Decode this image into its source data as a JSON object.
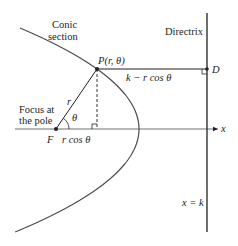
{
  "diagram": {
    "type": "conic-section-polar",
    "labels": {
      "conic_line1": "Conic",
      "conic_line2": "section",
      "directrix": "Directrix",
      "point_p": "P(r, θ)",
      "point_d": "D",
      "distance_pd": "k − r cos θ",
      "focus_line1": "Focus at",
      "focus_line2": "the pole",
      "focus": "F",
      "r": "r",
      "theta": "θ",
      "r_cos_theta": "r cos θ",
      "x_axis": "x",
      "directrix_eq": "x = k"
    },
    "colors": {
      "ink": "#231f20",
      "curve": "#4d4d4f"
    }
  }
}
